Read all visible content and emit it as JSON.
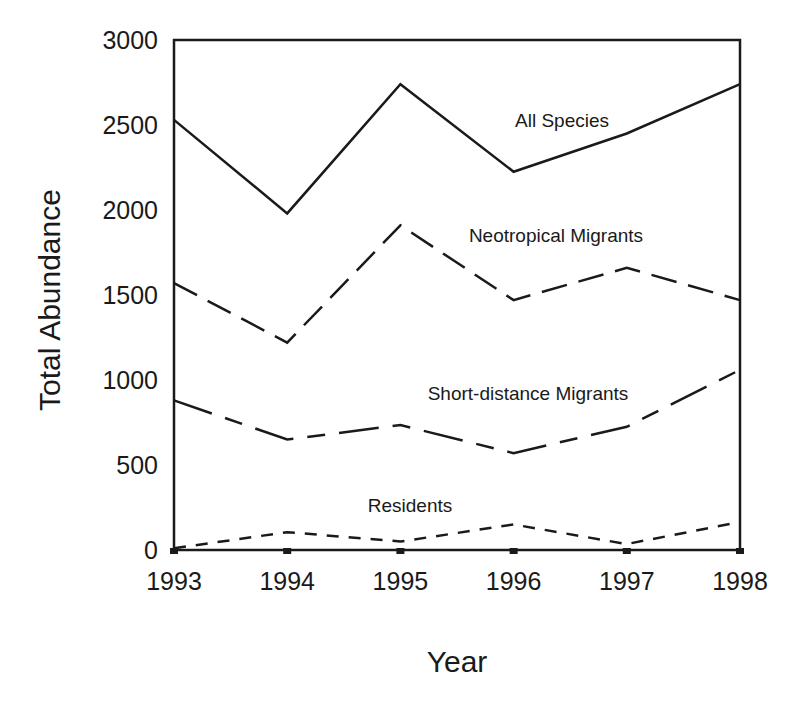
{
  "chart_data": {
    "type": "line",
    "title": "",
    "xlabel": "Year",
    "ylabel": "Total Abundance",
    "x": [
      1993,
      1994,
      1995,
      1996,
      1997,
      1998
    ],
    "xticks": [
      "1993",
      "1994",
      "1995",
      "1996",
      "1997",
      "1998"
    ],
    "yticks": [
      "0",
      "500",
      "1000",
      "1500",
      "2000",
      "2500",
      "3000"
    ],
    "ylim": [
      0,
      3000
    ],
    "grid": false,
    "legend": "inline labels",
    "series": [
      {
        "name": "All Species",
        "style": "solid",
        "values": [
          2530,
          1980,
          2740,
          2225,
          2450,
          2740
        ]
      },
      {
        "name": "Neotropical Migrants",
        "style": "long-dash",
        "values": [
          1570,
          1220,
          1910,
          1470,
          1660,
          1470
        ]
      },
      {
        "name": "Short-distance Migrants",
        "style": "dash-dot",
        "values": [
          880,
          650,
          735,
          570,
          725,
          1060
        ]
      },
      {
        "name": "Residents",
        "style": "short-dash",
        "values": [
          10,
          105,
          50,
          150,
          35,
          165
        ]
      }
    ],
    "colors": {
      "line": "#1a1a1a",
      "background": "#ffffff"
    }
  }
}
